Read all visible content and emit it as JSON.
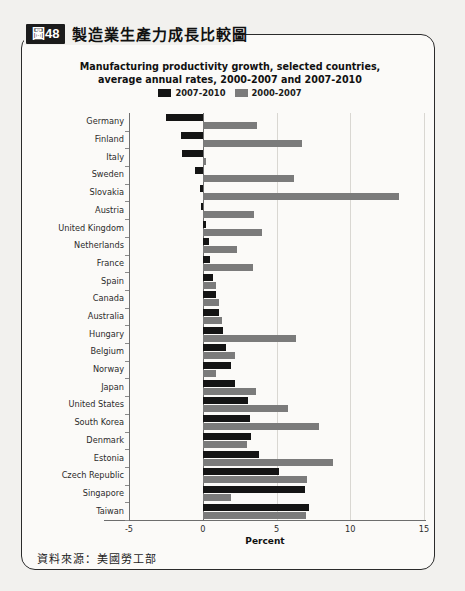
{
  "figure": {
    "badge": "圖48",
    "caption_cn": "製造業生產力成長比較圖",
    "source_cn": "資料來源：美國勞工部"
  },
  "colors": {
    "series_2007_2010": "#141414",
    "series_2000_2007": "#7b7b7b",
    "frame": "#2b2b2b",
    "page_background": "#f2f1ee",
    "panel_background": "#fbfaf8",
    "grid": "#d9d7d2",
    "axis": "#6d6d6d"
  },
  "chart_data": {
    "type": "bar",
    "orientation": "horizontal",
    "title": "Manufacturing productivity growth, selected countries,\naverage annual rates, 2000-2007 and 2007-2010",
    "title_line1": "Manufacturing productivity growth, selected countries,",
    "title_line2": "average annual rates, 2000-2007 and 2007-2010",
    "xlabel": "Percent",
    "ylabel": "",
    "xlim": [
      -5,
      15
    ],
    "xticks": [
      -5,
      0,
      5,
      10,
      15
    ],
    "xticklabels": [
      "-5",
      "0",
      "5",
      "10",
      "15"
    ],
    "grid": true,
    "legend_position": "top-center",
    "categories": [
      "Germany",
      "Finland",
      "Italy",
      "Sweden",
      "Slovakia",
      "Austria",
      "United Kingdom",
      "Netherlands",
      "France",
      "Spain",
      "Canada",
      "Australia",
      "Hungary",
      "Belgium",
      "Norway",
      "Japan",
      "United States",
      "South Korea",
      "Denmark",
      "Estonia",
      "Czech Republic",
      "Singapore",
      "Taiwan"
    ],
    "series": [
      {
        "name": "2007-2010",
        "color": "#141414",
        "values": [
          -2.5,
          -1.5,
          -1.4,
          -0.5,
          -0.2,
          -0.1,
          0.2,
          0.4,
          0.5,
          0.7,
          0.9,
          1.1,
          1.4,
          1.6,
          1.9,
          2.2,
          3.1,
          3.2,
          3.3,
          3.8,
          5.2,
          6.9,
          7.2
        ]
      },
      {
        "name": "2000-2007",
        "color": "#7b7b7b",
        "values": [
          3.7,
          6.7,
          0.2,
          6.2,
          13.3,
          3.5,
          4.0,
          2.3,
          3.4,
          0.9,
          1.1,
          1.3,
          6.3,
          2.2,
          0.9,
          3.6,
          5.8,
          7.9,
          3.0,
          8.8,
          7.1,
          1.9,
          7.0
        ]
      }
    ],
    "legend": [
      {
        "label": "2007-2010",
        "color": "#141414"
      },
      {
        "label": "2000-2007",
        "color": "#7b7b7b"
      }
    ]
  }
}
